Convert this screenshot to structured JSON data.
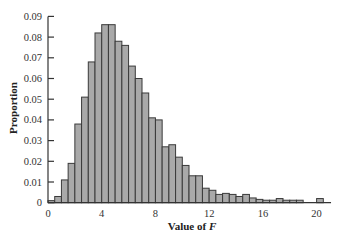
{
  "chart_data": {
    "type": "bar",
    "title": "",
    "xlabel": "Value of F",
    "xlabel_parts": {
      "text": "Value of ",
      "italic": "F"
    },
    "ylabel": "Proportion",
    "xlim": [
      0,
      21
    ],
    "ylim": [
      0,
      0.09
    ],
    "bin_width": 0.5,
    "grid": false,
    "legend": null,
    "x_ticks": [
      0,
      4,
      8,
      12,
      16,
      20
    ],
    "x_tick_labels": [
      "0",
      "4",
      "8",
      "12",
      "16",
      "20"
    ],
    "y_ticks": [
      0,
      0.01,
      0.02,
      0.03,
      0.04,
      0.05,
      0.06,
      0.07,
      0.08,
      0.09
    ],
    "y_tick_labels": [
      "0",
      "0.01",
      "0.02",
      "0.03",
      "0.04",
      "0.05",
      "0.06",
      "0.07",
      "0.08",
      "0.09"
    ],
    "bin_starts": [
      0,
      0.5,
      1,
      1.5,
      2,
      2.5,
      3,
      3.5,
      4,
      4.5,
      5,
      5.5,
      6,
      6.5,
      7,
      7.5,
      8,
      8.5,
      9,
      9.5,
      10,
      10.5,
      11,
      11.5,
      12,
      12.5,
      13,
      13.5,
      14,
      14.5,
      15,
      15.5,
      16,
      16.5,
      17,
      17.5,
      18,
      18.5,
      19,
      19.5,
      20
    ],
    "values": [
      0.001,
      0.003,
      0.011,
      0.019,
      0.038,
      0.051,
      0.068,
      0.082,
      0.086,
      0.086,
      0.078,
      0.076,
      0.066,
      0.06,
      0.053,
      0.041,
      0.04,
      0.027,
      0.028,
      0.022,
      0.018,
      0.013,
      0.013,
      0.007,
      0.006,
      0.004,
      0.0045,
      0.004,
      0.003,
      0.004,
      0.0023,
      0.0016,
      0.0012,
      0.0012,
      0.002,
      0.0012,
      0.0012,
      0.0012,
      0,
      0,
      0.002
    ],
    "colors": {
      "bar_fill": "#a9a9a9",
      "bar_edge": "#3a3a3a",
      "axis": "#333333"
    }
  }
}
